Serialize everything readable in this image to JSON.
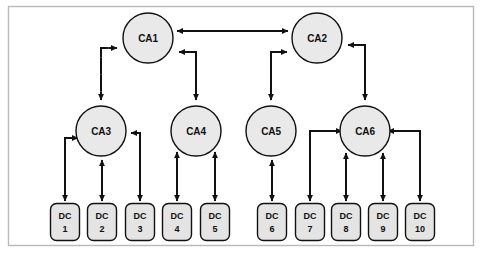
{
  "figure": {
    "frame": {
      "x": 8,
      "y": 6,
      "width": 466,
      "height": 240,
      "color": "#b9b9b9"
    },
    "canvas": {
      "width": 482,
      "height": 253,
      "background": "#ffffff"
    },
    "style": {
      "circle_fill": "#e9e9e9",
      "box_fill": "#e4e4e4",
      "stroke": "#111111",
      "text_color": "#101010"
    }
  },
  "nodes": {
    "authorities": [
      {
        "id": "ca1",
        "label": "CA1",
        "cx": 148,
        "cy": 38,
        "r": 25,
        "tier": 1
      },
      {
        "id": "ca2",
        "label": "CA2",
        "cx": 317,
        "cy": 38,
        "r": 25,
        "tier": 1
      },
      {
        "id": "ca3",
        "label": "CA3",
        "cx": 101,
        "cy": 131,
        "r": 25,
        "tier": 2
      },
      {
        "id": "ca4",
        "label": "CA4",
        "cx": 196,
        "cy": 131,
        "r": 25,
        "tier": 2
      },
      {
        "id": "ca5",
        "label": "CA5",
        "cx": 271,
        "cy": 131,
        "r": 25,
        "tier": 2
      },
      {
        "id": "ca6",
        "label": "CA6",
        "cx": 365,
        "cy": 131,
        "r": 25,
        "tier": 2
      }
    ],
    "centers": [
      {
        "id": "dc1",
        "line1": "DC",
        "line2": "1",
        "cx": 65,
        "cy": 222
      },
      {
        "id": "dc2",
        "line1": "DC",
        "line2": "2",
        "cx": 102,
        "cy": 222
      },
      {
        "id": "dc3",
        "line1": "DC",
        "line2": "3",
        "cx": 140,
        "cy": 222
      },
      {
        "id": "dc4",
        "line1": "DC",
        "line2": "4",
        "cx": 177,
        "cy": 222
      },
      {
        "id": "dc5",
        "line1": "DC",
        "line2": "5",
        "cx": 215,
        "cy": 222
      },
      {
        "id": "dc6",
        "line1": "DC",
        "line2": "6",
        "cx": 272,
        "cy": 222
      },
      {
        "id": "dc7",
        "line1": "DC",
        "line2": "7",
        "cx": 310,
        "cy": 222
      },
      {
        "id": "dc8",
        "line1": "DC",
        "line2": "8",
        "cx": 346,
        "cy": 222
      },
      {
        "id": "dc9",
        "line1": "DC",
        "line2": "9",
        "cx": 383,
        "cy": 222
      },
      {
        "id": "dc10",
        "line1": "DC",
        "line2": "10",
        "cx": 420,
        "cy": 222
      }
    ],
    "box_geometry": {
      "width": 29,
      "height": 37,
      "rx": 6
    }
  },
  "edges": [
    {
      "id": "ca1-ca2",
      "from": "ca1",
      "to": "ca2",
      "style": "dashed",
      "arrows": "both",
      "route": "horizontal"
    },
    {
      "id": "ca1-ca3",
      "from": "ca1",
      "to": "ca3",
      "style": "dashed",
      "arrows": "both",
      "route": "elbow-left"
    },
    {
      "id": "ca1-ca4",
      "from": "ca1",
      "to": "ca4",
      "style": "solid",
      "arrows": "both",
      "route": "elbow-right"
    },
    {
      "id": "ca2-ca5",
      "from": "ca2",
      "to": "ca5",
      "style": "solid",
      "arrows": "both",
      "route": "elbow-left"
    },
    {
      "id": "ca2-ca6",
      "from": "ca2",
      "to": "ca6",
      "style": "solid",
      "arrows": "both",
      "route": "elbow-right"
    },
    {
      "id": "ca3-dc1",
      "from": "ca3",
      "to": "dc1",
      "style": "solid",
      "arrows": "both",
      "route": "elbow-left"
    },
    {
      "id": "ca3-dc2",
      "from": "ca3",
      "to": "dc2",
      "style": "solid",
      "arrows": "both",
      "route": "vertical"
    },
    {
      "id": "ca3-dc3",
      "from": "ca3",
      "to": "dc3",
      "style": "dashed",
      "arrows": "both",
      "route": "elbow-right"
    },
    {
      "id": "ca4-dc4",
      "from": "ca4",
      "to": "dc4",
      "style": "solid",
      "arrows": "both",
      "route": "vertical"
    },
    {
      "id": "ca4-dc5",
      "from": "ca4",
      "to": "dc5",
      "style": "solid",
      "arrows": "both",
      "route": "vertical"
    },
    {
      "id": "ca5-dc6",
      "from": "ca5",
      "to": "dc6",
      "style": "solid",
      "arrows": "both",
      "route": "vertical"
    },
    {
      "id": "ca6-dc7",
      "from": "ca6",
      "to": "dc7",
      "style": "solid",
      "arrows": "both",
      "route": "elbow-left"
    },
    {
      "id": "ca6-dc8",
      "from": "ca6",
      "to": "dc8",
      "style": "solid",
      "arrows": "both",
      "route": "vertical"
    },
    {
      "id": "ca6-dc9",
      "from": "ca6",
      "to": "dc9",
      "style": "solid",
      "arrows": "both",
      "route": "vertical"
    },
    {
      "id": "ca6-dc10",
      "from": "ca6",
      "to": "dc10",
      "style": "solid",
      "arrows": "both",
      "route": "elbow-right"
    }
  ]
}
